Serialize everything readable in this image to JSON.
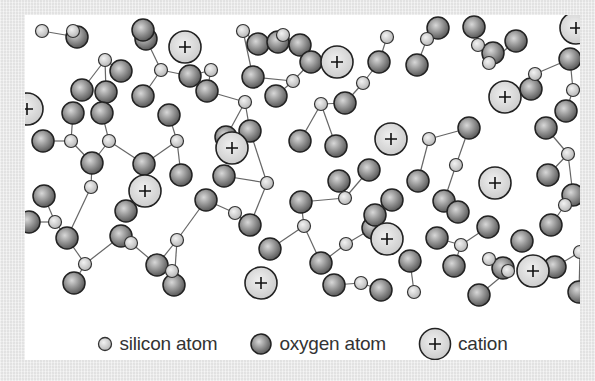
{
  "diagram": {
    "type": "silicate glass network",
    "colors": {
      "background": "#ebebeb",
      "panel": "#ffffff",
      "bond": "#666666",
      "atom_outline": "#222222",
      "silicon_fill": "#d2d2d2",
      "oxygen_fill": "#8a8a8a",
      "cation_fill": "#dcdcdc"
    },
    "legend": {
      "silicon": {
        "label": "silicon atom",
        "icon": "silicon-atom-icon"
      },
      "oxygen": {
        "label": "oxygen atom",
        "icon": "oxygen-atom-icon"
      },
      "cation": {
        "label": "cation",
        "icon": "cation-icon",
        "symbol": "+"
      }
    },
    "cations": [
      [
        160,
        32
      ],
      [
        312,
        47
      ],
      [
        480,
        82
      ],
      [
        2,
        94
      ],
      [
        207,
        133
      ],
      [
        366,
        124
      ],
      [
        120,
        176
      ],
      [
        470,
        168
      ],
      [
        362,
        224
      ],
      [
        236,
        268
      ],
      [
        508,
        256
      ],
      [
        551,
        13
      ]
    ],
    "silicon": [
      [
        48,
        16
      ],
      [
        80,
        45
      ],
      [
        136,
        55
      ],
      [
        186,
        55
      ],
      [
        218,
        16
      ],
      [
        258,
        20
      ],
      [
        268,
        66
      ],
      [
        338,
        68
      ],
      [
        362,
        22
      ],
      [
        402,
        24
      ],
      [
        453,
        30
      ],
      [
        464,
        48
      ],
      [
        510,
        59
      ],
      [
        548,
        75
      ],
      [
        46,
        126
      ],
      [
        84,
        126
      ],
      [
        66,
        172
      ],
      [
        152,
        126
      ],
      [
        220,
        87
      ],
      [
        242,
        168
      ],
      [
        296,
        89
      ],
      [
        320,
        183
      ],
      [
        404,
        124
      ],
      [
        431,
        150
      ],
      [
        543,
        139
      ],
      [
        30,
        207
      ],
      [
        60,
        249
      ],
      [
        106,
        228
      ],
      [
        152,
        225
      ],
      [
        210,
        198
      ],
      [
        279,
        211
      ],
      [
        321,
        229
      ],
      [
        336,
        268
      ],
      [
        389,
        277
      ],
      [
        436,
        230
      ],
      [
        464,
        244
      ],
      [
        483,
        256
      ],
      [
        540,
        190
      ],
      [
        555,
        237
      ],
      [
        147,
        256
      ],
      [
        17,
        16
      ]
    ],
    "oxygen": [
      [
        52,
        22
      ],
      [
        121,
        24
      ],
      [
        96,
        56
      ],
      [
        57,
        75
      ],
      [
        81,
        77
      ],
      [
        118,
        81
      ],
      [
        165,
        61
      ],
      [
        233,
        29
      ],
      [
        228,
        62
      ],
      [
        253,
        27
      ],
      [
        275,
        30
      ],
      [
        286,
        47
      ],
      [
        251,
        81
      ],
      [
        320,
        88
      ],
      [
        354,
        47
      ],
      [
        392,
        50
      ],
      [
        413,
        13
      ],
      [
        449,
        12
      ],
      [
        468,
        38
      ],
      [
        491,
        26
      ],
      [
        506,
        74
      ],
      [
        545,
        44
      ],
      [
        541,
        96
      ],
      [
        118,
        15
      ],
      [
        18,
        126
      ],
      [
        48,
        98
      ],
      [
        77,
        98
      ],
      [
        144,
        100
      ],
      [
        67,
        148
      ],
      [
        119,
        149
      ],
      [
        182,
        76
      ],
      [
        201,
        122
      ],
      [
        225,
        116
      ],
      [
        199,
        161
      ],
      [
        275,
        126
      ],
      [
        311,
        131
      ],
      [
        314,
        166
      ],
      [
        344,
        155
      ],
      [
        393,
        166
      ],
      [
        444,
        113
      ],
      [
        419,
        186
      ],
      [
        521,
        113
      ],
      [
        523,
        160
      ],
      [
        548,
        180
      ],
      [
        4,
        207
      ],
      [
        42,
        223
      ],
      [
        49,
        268
      ],
      [
        96,
        221
      ],
      [
        132,
        250
      ],
      [
        181,
        185
      ],
      [
        225,
        210
      ],
      [
        276,
        187
      ],
      [
        309,
        270
      ],
      [
        348,
        213
      ],
      [
        367,
        185
      ],
      [
        356,
        275
      ],
      [
        385,
        246
      ],
      [
        429,
        251
      ],
      [
        454,
        280
      ],
      [
        497,
        226
      ],
      [
        554,
        277
      ],
      [
        149,
        270
      ],
      [
        433,
        197
      ],
      [
        478,
        253
      ],
      [
        526,
        210
      ],
      [
        19,
        181
      ],
      [
        101,
        196
      ],
      [
        156,
        160
      ],
      [
        245,
        234
      ],
      [
        296,
        248
      ],
      [
        350,
        200
      ],
      [
        412,
        223
      ],
      [
        463,
        212
      ],
      [
        530,
        252
      ]
    ],
    "bonds": [
      [
        [
          48,
          16
        ],
        [
          52,
          22
        ]
      ],
      [
        [
          80,
          45
        ],
        [
          57,
          75
        ]
      ],
      [
        [
          80,
          45
        ],
        [
          96,
          56
        ]
      ],
      [
        [
          80,
          45
        ],
        [
          81,
          77
        ]
      ],
      [
        [
          136,
          55
        ],
        [
          118,
          81
        ]
      ],
      [
        [
          136,
          55
        ],
        [
          165,
          61
        ]
      ],
      [
        [
          136,
          55
        ],
        [
          121,
          24
        ]
      ],
      [
        [
          186,
          55
        ],
        [
          165,
          61
        ]
      ],
      [
        [
          186,
          55
        ],
        [
          182,
          76
        ]
      ],
      [
        [
          218,
          16
        ],
        [
          233,
          29
        ]
      ],
      [
        [
          218,
          16
        ],
        [
          228,
          62
        ]
      ],
      [
        [
          258,
          20
        ],
        [
          253,
          27
        ]
      ],
      [
        [
          258,
          20
        ],
        [
          275,
          30
        ]
      ],
      [
        [
          268,
          66
        ],
        [
          286,
          47
        ]
      ],
      [
        [
          268,
          66
        ],
        [
          251,
          81
        ]
      ],
      [
        [
          268,
          66
        ],
        [
          228,
          62
        ]
      ],
      [
        [
          338,
          68
        ],
        [
          354,
          47
        ]
      ],
      [
        [
          338,
          68
        ],
        [
          320,
          88
        ]
      ],
      [
        [
          362,
          22
        ],
        [
          354,
          47
        ]
      ],
      [
        [
          402,
          24
        ],
        [
          392,
          50
        ]
      ],
      [
        [
          402,
          24
        ],
        [
          413,
          13
        ]
      ],
      [
        [
          453,
          30
        ],
        [
          449,
          12
        ]
      ],
      [
        [
          464,
          48
        ],
        [
          468,
          38
        ]
      ],
      [
        [
          464,
          48
        ],
        [
          491,
          26
        ]
      ],
      [
        [
          510,
          59
        ],
        [
          506,
          74
        ]
      ],
      [
        [
          510,
          59
        ],
        [
          545,
          44
        ]
      ],
      [
        [
          548,
          75
        ],
        [
          541,
          96
        ]
      ],
      [
        [
          548,
          75
        ],
        [
          545,
          44
        ]
      ],
      [
        [
          46,
          126
        ],
        [
          18,
          126
        ]
      ],
      [
        [
          46,
          126
        ],
        [
          48,
          98
        ]
      ],
      [
        [
          46,
          126
        ],
        [
          67,
          148
        ]
      ],
      [
        [
          84,
          126
        ],
        [
          77,
          98
        ]
      ],
      [
        [
          84,
          126
        ],
        [
          119,
          149
        ]
      ],
      [
        [
          84,
          126
        ],
        [
          67,
          148
        ]
      ],
      [
        [
          66,
          172
        ],
        [
          67,
          148
        ]
      ],
      [
        [
          66,
          172
        ],
        [
          42,
          223
        ]
      ],
      [
        [
          152,
          126
        ],
        [
          144,
          100
        ]
      ],
      [
        [
          152,
          126
        ],
        [
          119,
          149
        ]
      ],
      [
        [
          152,
          126
        ],
        [
          156,
          160
        ]
      ],
      [
        [
          220,
          87
        ],
        [
          182,
          76
        ]
      ],
      [
        [
          220,
          87
        ],
        [
          201,
          122
        ]
      ],
      [
        [
          220,
          87
        ],
        [
          225,
          116
        ]
      ],
      [
        [
          296,
          89
        ],
        [
          320,
          88
        ]
      ],
      [
        [
          296,
          89
        ],
        [
          275,
          126
        ]
      ],
      [
        [
          296,
          89
        ],
        [
          311,
          131
        ]
      ],
      [
        [
          242,
          168
        ],
        [
          199,
          161
        ]
      ],
      [
        [
          242,
          168
        ],
        [
          225,
          116
        ]
      ],
      [
        [
          242,
          168
        ],
        [
          225,
          210
        ]
      ],
      [
        [
          320,
          183
        ],
        [
          314,
          166
        ]
      ],
      [
        [
          320,
          183
        ],
        [
          344,
          155
        ]
      ],
      [
        [
          320,
          183
        ],
        [
          276,
          187
        ]
      ],
      [
        [
          404,
          124
        ],
        [
          444,
          113
        ]
      ],
      [
        [
          404,
          124
        ],
        [
          393,
          166
        ]
      ],
      [
        [
          431,
          150
        ],
        [
          444,
          113
        ]
      ],
      [
        [
          431,
          150
        ],
        [
          419,
          186
        ]
      ],
      [
        [
          543,
          139
        ],
        [
          521,
          113
        ]
      ],
      [
        [
          543,
          139
        ],
        [
          523,
          160
        ]
      ],
      [
        [
          543,
          139
        ],
        [
          548,
          180
        ]
      ],
      [
        [
          30,
          207
        ],
        [
          4,
          207
        ]
      ],
      [
        [
          30,
          207
        ],
        [
          42,
          223
        ]
      ],
      [
        [
          30,
          207
        ],
        [
          19,
          181
        ]
      ],
      [
        [
          60,
          249
        ],
        [
          42,
          223
        ]
      ],
      [
        [
          60,
          249
        ],
        [
          49,
          268
        ]
      ],
      [
        [
          60,
          249
        ],
        [
          96,
          221
        ]
      ],
      [
        [
          106,
          228
        ],
        [
          96,
          221
        ]
      ],
      [
        [
          106,
          228
        ],
        [
          132,
          250
        ]
      ],
      [
        [
          152,
          225
        ],
        [
          181,
          185
        ]
      ],
      [
        [
          152,
          225
        ],
        [
          132,
          250
        ]
      ],
      [
        [
          152,
          225
        ],
        [
          149,
          270
        ]
      ],
      [
        [
          210,
          198
        ],
        [
          181,
          185
        ]
      ],
      [
        [
          210,
          198
        ],
        [
          225,
          210
        ]
      ],
      [
        [
          279,
          211
        ],
        [
          276,
          187
        ]
      ],
      [
        [
          279,
          211
        ],
        [
          245,
          234
        ]
      ],
      [
        [
          279,
          211
        ],
        [
          296,
          248
        ]
      ],
      [
        [
          321,
          229
        ],
        [
          348,
          213
        ]
      ],
      [
        [
          321,
          229
        ],
        [
          296,
          248
        ]
      ],
      [
        [
          336,
          268
        ],
        [
          309,
          270
        ]
      ],
      [
        [
          336,
          268
        ],
        [
          356,
          275
        ]
      ],
      [
        [
          389,
          277
        ],
        [
          385,
          246
        ]
      ],
      [
        [
          436,
          230
        ],
        [
          412,
          223
        ]
      ],
      [
        [
          436,
          230
        ],
        [
          429,
          251
        ]
      ],
      [
        [
          436,
          230
        ],
        [
          463,
          212
        ]
      ],
      [
        [
          464,
          244
        ],
        [
          478,
          253
        ]
      ],
      [
        [
          483,
          256
        ],
        [
          454,
          280
        ]
      ],
      [
        [
          540,
          190
        ],
        [
          548,
          180
        ]
      ],
      [
        [
          540,
          190
        ],
        [
          526,
          210
        ]
      ],
      [
        [
          555,
          237
        ],
        [
          530,
          252
        ]
      ],
      [
        [
          555,
          237
        ],
        [
          554,
          277
        ]
      ],
      [
        [
          17,
          16
        ],
        [
          52,
          22
        ]
      ]
    ]
  }
}
